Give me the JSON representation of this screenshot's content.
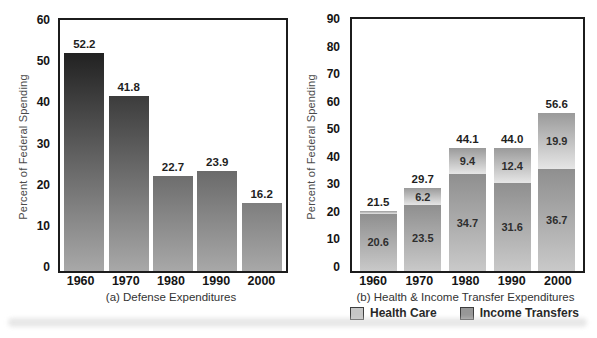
{
  "chart_data": [
    {
      "type": "bar",
      "title": "(a) Defense Expenditures",
      "ylabel": "Percent of Federal Spending",
      "categories": [
        "1960",
        "1970",
        "1980",
        "1990",
        "2000"
      ],
      "values": [
        52.2,
        41.8,
        22.7,
        23.9,
        16.2
      ],
      "value_labels": [
        "52.2",
        "41.8",
        "22.7",
        "23.9",
        "16.2"
      ],
      "ylim": [
        0,
        60
      ],
      "ytick_step": 10,
      "grid": false,
      "legend_position": "none"
    },
    {
      "type": "stacked-bar",
      "title": "(b) Health & Income Transfer Expenditures",
      "ylabel": "Percent of Federal Spending",
      "categories": [
        "1960",
        "1970",
        "1980",
        "1990",
        "2000"
      ],
      "series": [
        {
          "name": "Health Care",
          "values": [
            0.9,
            6.2,
            9.4,
            12.4,
            19.9
          ],
          "labels": [
            "0.9",
            "6.2",
            "9.4",
            "12.4",
            "19.9"
          ]
        },
        {
          "name": "Income Transfers",
          "values": [
            20.6,
            23.5,
            34.7,
            31.6,
            36.7
          ],
          "labels": [
            "20.6",
            "23.5",
            "34.7",
            "31.6",
            "36.7"
          ]
        }
      ],
      "totals": [
        21.5,
        29.7,
        44.1,
        44.0,
        56.6
      ],
      "total_labels": [
        "21.5",
        "29.7",
        "44.1",
        "44.0",
        "56.6"
      ],
      "ylim": [
        0,
        90
      ],
      "ytick_step": 10,
      "grid": false,
      "legend_position": "bottom",
      "legend": [
        {
          "label": "Health Care",
          "swatch": "#c6c6c6"
        },
        {
          "label": "Income Transfers",
          "swatch": "#979797"
        }
      ]
    }
  ],
  "colors": {
    "background": "#ffffff",
    "axis_border": "#1c1c1c",
    "shadow_top": "#0a0a0a",
    "shadow_side": "#8d8d8d",
    "defense_bar_top": "#0d0d0d",
    "defense_bar_bottom": "#a8a8a8",
    "health_care_top": "#9a9a9a",
    "health_care_bottom": "#e6e6e6",
    "income_transfers_top": "#8f8f8f",
    "income_transfers_bottom": "#c9c9c9",
    "label_text": "#1f1f1f",
    "caption_text": "#333333"
  }
}
